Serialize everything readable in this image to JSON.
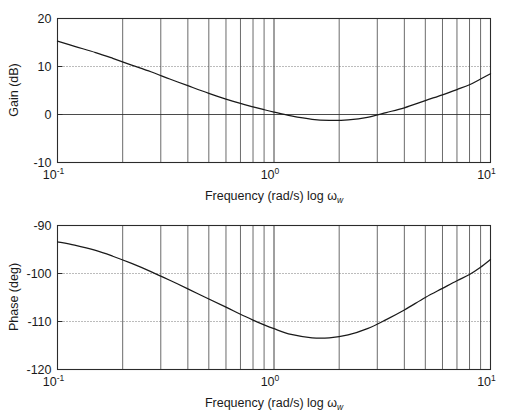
{
  "figure": {
    "name": "bode-plot",
    "background_color": "#ffffff",
    "curve_color": "#1a1a1a",
    "grid_color": "#2b2b2b",
    "dotted_grid_color": "#555555"
  },
  "chart_data": [
    {
      "type": "line",
      "panel": "gain",
      "title": "",
      "xlabel": "Frequency (rad/s) log ω",
      "xlabel_sub": "w",
      "ylabel": "Gain (dB)",
      "xscale": "log",
      "xlim": [
        0.1,
        10
      ],
      "ylim": [
        -10,
        20
      ],
      "yticks": [
        20,
        10,
        0,
        -10
      ],
      "ytick_labels": [
        "20",
        "10",
        "0",
        "-10"
      ],
      "xticks": [
        0.1,
        1,
        10
      ],
      "xtick_bases": [
        "10",
        "10",
        "10"
      ],
      "xtick_exponents": [
        "-1",
        "0",
        "1"
      ],
      "grid": true,
      "legend": "none",
      "horizontal_gridlines": [
        {
          "value": 10,
          "style": "dotted"
        },
        {
          "value": 0,
          "style": "solid"
        }
      ],
      "minor_x_gridlines": [
        0.2,
        0.3,
        0.4,
        0.5,
        0.6,
        0.7,
        0.8,
        0.9,
        2,
        3,
        4,
        5,
        6,
        7,
        8,
        9
      ],
      "x": [
        0.1,
        0.12,
        0.15,
        0.18,
        0.22,
        0.27,
        0.33,
        0.4,
        0.5,
        0.6,
        0.7,
        0.8,
        0.9,
        1.0,
        1.2,
        1.5,
        1.8,
        2.2,
        2.7,
        3.3,
        4.0,
        5.0,
        6.0,
        7.0,
        8.0,
        9.0,
        10.0
      ],
      "values": [
        15.3,
        14.2,
        12.9,
        11.7,
        10.3,
        8.9,
        7.4,
        6.0,
        4.4,
        3.2,
        2.3,
        1.6,
        1.0,
        0.5,
        -0.3,
        -1.0,
        -1.2,
        -1.1,
        -0.6,
        0.4,
        1.4,
        2.9,
        4.1,
        5.2,
        6.2,
        7.4,
        8.5
      ]
    },
    {
      "type": "line",
      "panel": "phase",
      "title": "",
      "xlabel": "Frequency (rad/s) log ω",
      "xlabel_sub": "w",
      "ylabel": "Phase (deg)",
      "xscale": "log",
      "xlim": [
        0.1,
        10
      ],
      "ylim": [
        -120,
        -90
      ],
      "yticks": [
        -90,
        -100,
        -110,
        -120
      ],
      "ytick_labels": [
        "-90",
        "-100",
        "-110",
        "-120"
      ],
      "xticks": [
        0.1,
        1,
        10
      ],
      "xtick_bases": [
        "10",
        "10",
        "10"
      ],
      "xtick_exponents": [
        "-1",
        "0",
        "1"
      ],
      "grid": true,
      "legend": "none",
      "horizontal_gridlines": [
        {
          "value": -100,
          "style": "dotted"
        },
        {
          "value": -110,
          "style": "dotted"
        }
      ],
      "minor_x_gridlines": [
        0.2,
        0.3,
        0.4,
        0.5,
        0.6,
        0.7,
        0.8,
        0.9,
        2,
        3,
        4,
        5,
        6,
        7,
        8,
        9
      ],
      "x": [
        0.1,
        0.12,
        0.15,
        0.18,
        0.22,
        0.27,
        0.33,
        0.4,
        0.5,
        0.6,
        0.7,
        0.8,
        0.9,
        1.0,
        1.2,
        1.5,
        1.8,
        2.2,
        2.7,
        3.3,
        4.0,
        5.0,
        6.0,
        7.0,
        8.0,
        9.0,
        10.0
      ],
      "values": [
        -93.4,
        -94.1,
        -95.2,
        -96.4,
        -97.9,
        -99.6,
        -101.4,
        -103.2,
        -105.3,
        -107.0,
        -108.5,
        -109.7,
        -110.7,
        -111.5,
        -112.7,
        -113.4,
        -113.4,
        -112.8,
        -111.5,
        -109.6,
        -107.6,
        -105.0,
        -103.1,
        -101.5,
        -100.2,
        -98.7,
        -97.1
      ]
    }
  ]
}
